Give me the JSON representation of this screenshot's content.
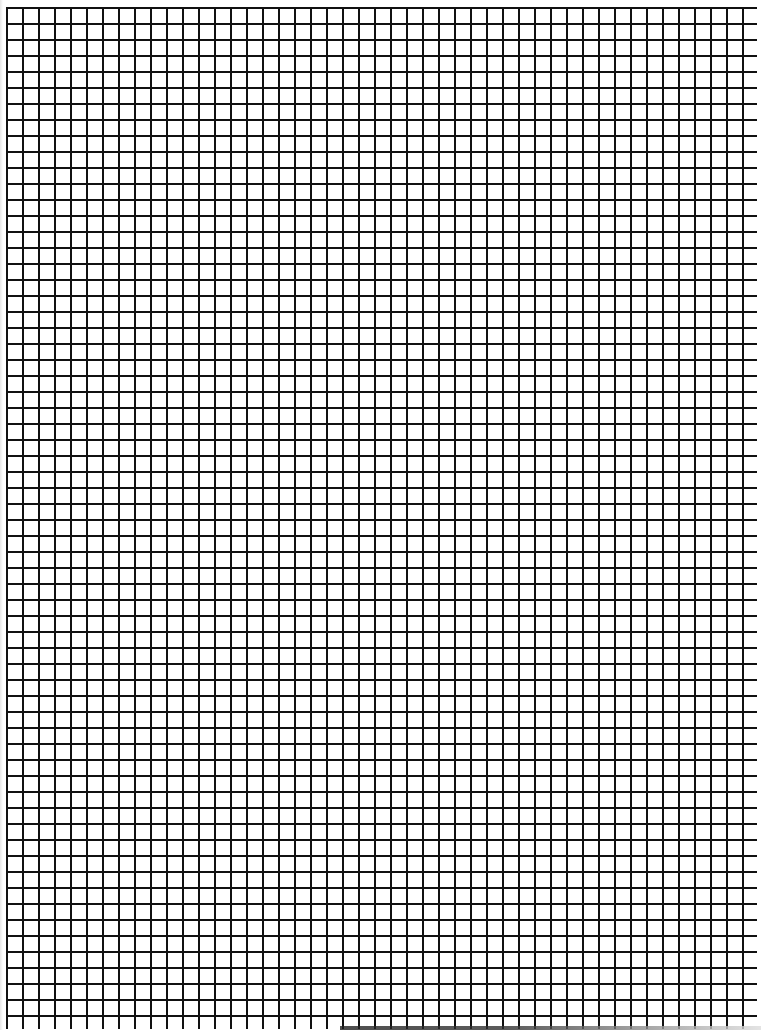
{
  "page": {
    "type": "grid-paper",
    "width": 761,
    "height": 1030
  },
  "grid": {
    "cell_size_px": 16,
    "line_width_px": 2,
    "line_color": "#111111",
    "background_color": "#ffffff",
    "offset_x": 6,
    "offset_y": 7
  }
}
